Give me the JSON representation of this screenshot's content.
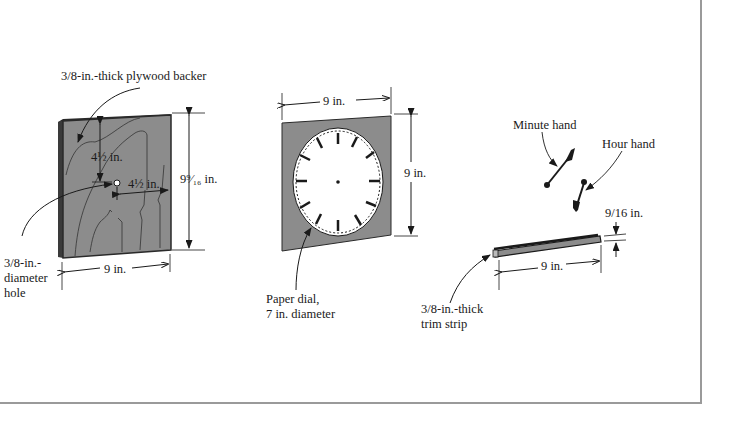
{
  "figure": {
    "colors": {
      "panel_fill": "#8c8c8c",
      "panel_edge": "#2a2a2a",
      "dial_fill": "#ffffff",
      "ink": "#1a1a1a",
      "frame": "#9a9a9a"
    },
    "backer": {
      "title": "3/8-in.-thick plywood backer",
      "dim_vertical_offset": "4½ in.",
      "dim_horizontal_offset": "4½ in.",
      "dim_height": "9⁹⁄₁₆ in.",
      "dim_width": "9 in.",
      "hole_label_line1": "3/8-in.-",
      "hole_label_line2": "diameter",
      "hole_label_line3": "hole"
    },
    "dial_panel": {
      "dim_width": "9 in.",
      "dim_height": "9 in.",
      "dial_label_line1": "Paper dial,",
      "dial_label_line2": "7 in. diameter"
    },
    "hands": {
      "minute_label": "Minute hand",
      "hour_label": "Hour hand"
    },
    "trim": {
      "dim_thickness": "9/16 in.",
      "dim_length": "9 in.",
      "label_line1": "3/8-in.-thick",
      "label_line2": "trim strip"
    }
  }
}
